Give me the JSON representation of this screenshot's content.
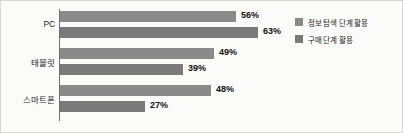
{
  "chart_data": {
    "type": "bar",
    "orientation": "horizontal",
    "title": "",
    "xlabel": "",
    "ylabel": "",
    "categories": [
      "PC",
      "태블릿",
      "스마트폰"
    ],
    "series": [
      {
        "name": "정보 탐색 단계 활용",
        "color": "#8a8a8a",
        "values": [
          56,
          49,
          48
        ],
        "value_labels": [
          "56%",
          "49%",
          "48%"
        ]
      },
      {
        "name": "구매 단계 활용",
        "color": "#7a7a7a",
        "values": [
          63,
          39,
          27
        ],
        "value_labels": [
          "63%",
          "39%",
          "27%"
        ]
      }
    ],
    "xlim": [
      0,
      70
    ],
    "unit": "%",
    "grid": false,
    "legend_position": "right"
  },
  "legend": {
    "items": [
      {
        "label": "정보 탐색 단계 활용"
      },
      {
        "label": "구매 단계 활용"
      }
    ]
  },
  "axis": {
    "category_labels": [
      "PC",
      "태블릿",
      "스마트폰"
    ]
  }
}
